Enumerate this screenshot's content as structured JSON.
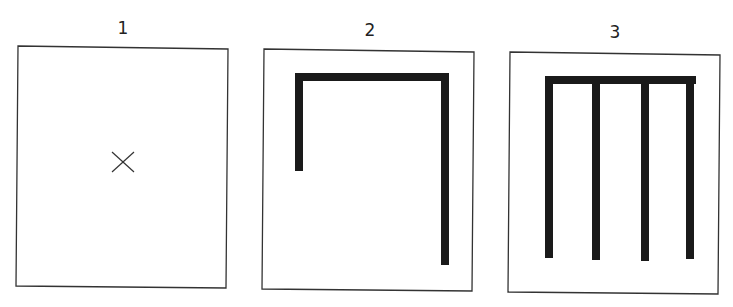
{
  "panels": [
    {
      "label": "1",
      "content": "cross-mark"
    },
    {
      "label": "2",
      "content": "two-leg-bracket"
    },
    {
      "label": "3",
      "content": "four-leg-comb"
    }
  ],
  "colors": {
    "stroke": "#1a1a1a",
    "frame": "#333333",
    "background": "#ffffff"
  }
}
